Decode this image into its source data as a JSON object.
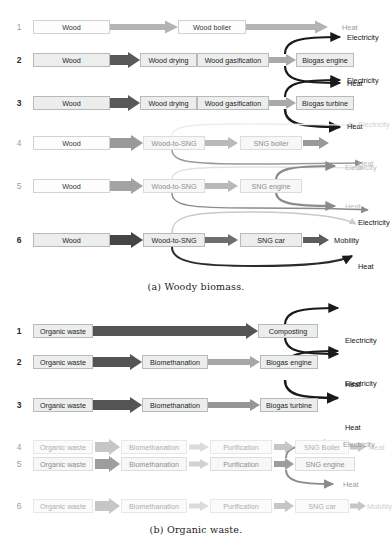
{
  "figure": {
    "caption_a": "(a) Woody biomass.",
    "caption_b": "(b) Organic waste."
  },
  "colors": {
    "arrow_darkest": "#595959",
    "arrow_dark": "#6e6e6e",
    "arrow_mid": "#8f8f8f",
    "arrow_light": "#b4b4b4",
    "arrow_lighter": "#d2d2d2",
    "arrow_faint": "#e4e4e4",
    "curve_black": "#1a1a1a",
    "curve_gray": "#8b8b8b",
    "curve_light": "#c9c9c9",
    "box_fill": "#eceded",
    "box_border": "#b9b9b9",
    "text": "#1e1e1e"
  },
  "panel_a": {
    "title": "Woody biomass",
    "pathways": [
      {
        "number": "1",
        "intensity": "light",
        "boxes": [
          "Wood",
          "Wood boiler"
        ],
        "outputs": [
          "Heat"
        ]
      },
      {
        "number": "2",
        "intensity": "dark",
        "boxes": [
          "Wood",
          "Wood drying",
          "Wood gasification",
          "Biogas engine"
        ],
        "outputs": [
          "Electricity",
          "Heat"
        ]
      },
      {
        "number": "3",
        "intensity": "dark",
        "boxes": [
          "Wood",
          "Wood drying",
          "Wood gasification",
          "Biogas turbine"
        ],
        "outputs": [
          "Electricity",
          "Heat"
        ]
      },
      {
        "number": "4",
        "intensity": "medium",
        "boxes": [
          "Wood",
          "Wood-to-SNG",
          "SNG boiler"
        ],
        "outputs": [
          "Electricity",
          "Heat"
        ]
      },
      {
        "number": "5",
        "intensity": "medium",
        "boxes": [
          "Wood",
          "Wood-to-SNG",
          "SNG engine"
        ],
        "outputs": [
          "Electricity",
          "Heat"
        ]
      },
      {
        "number": "6",
        "intensity": "dark",
        "boxes": [
          "Wood",
          "Wood-to-SNG",
          "SNG car"
        ],
        "outputs": [
          "Electricity",
          "Mobility",
          "Heat"
        ]
      }
    ]
  },
  "panel_b": {
    "title": "Organic waste",
    "pathways": [
      {
        "number": "1",
        "intensity": "dark",
        "boxes": [
          "Organic waste",
          "Composting"
        ],
        "outputs": []
      },
      {
        "number": "2",
        "intensity": "dark",
        "boxes": [
          "Organic waste",
          "Biomethanation",
          "Biogas engine"
        ],
        "outputs": [
          "Electricity",
          "Heat"
        ]
      },
      {
        "number": "3",
        "intensity": "dark",
        "boxes": [
          "Organic waste",
          "Biomethanation",
          "Biogas turbine"
        ],
        "outputs": [
          "Electricity",
          "Heat"
        ]
      },
      {
        "number": "4",
        "intensity": "faint",
        "boxes": [
          "Organic waste",
          "Biomethanation",
          "Purification",
          "SNG Boiler"
        ],
        "outputs": [
          "Heat"
        ]
      },
      {
        "number": "5",
        "intensity": "light",
        "boxes": [
          "Organic waste",
          "Biomethanation",
          "Purification",
          "SNG engine"
        ],
        "outputs": [
          "Electricity",
          "Heat"
        ]
      },
      {
        "number": "6",
        "intensity": "faint",
        "boxes": [
          "Organic waste",
          "Biomethanation",
          "Purification",
          "SNG car"
        ],
        "outputs": [
          "Mobility"
        ]
      }
    ]
  }
}
